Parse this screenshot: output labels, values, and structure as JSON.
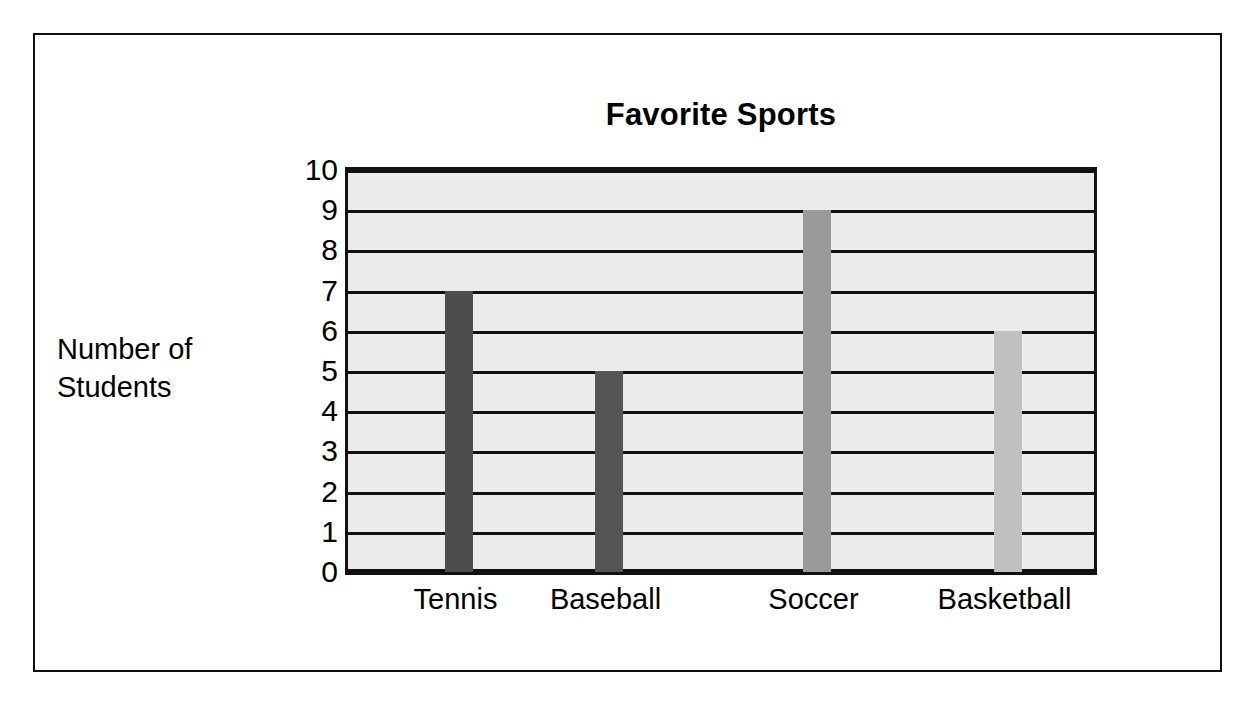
{
  "chart_data": {
    "type": "bar",
    "title": "Favorite Sports",
    "xlabel": "",
    "ylabel": "Number of Students",
    "ylabel_lines": [
      "Number of",
      "Students"
    ],
    "categories": [
      "Tennis",
      "Baseball",
      "Soccer",
      "Basketball"
    ],
    "values": [
      7,
      5,
      9,
      6
    ],
    "ylim": [
      0,
      10
    ],
    "ytick_labels": [
      "0",
      "1",
      "2",
      "3",
      "4",
      "5",
      "6",
      "7",
      "8",
      "9",
      "10"
    ],
    "grid": true,
    "legend": "none",
    "bar_colors": [
      "#4d4d4d",
      "#555555",
      "#9a9a9a",
      "#c0c0c0"
    ],
    "plot_background": "#ebebeb",
    "axis_color": "#111111",
    "page_background": "#ffffff"
  },
  "frame": {
    "border_color": "#111111"
  }
}
